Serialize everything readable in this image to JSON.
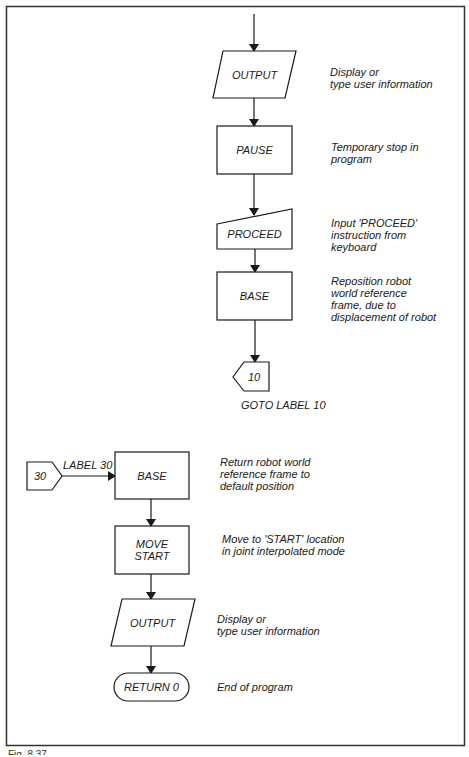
{
  "figure": {
    "type": "flowchart",
    "frame_color": "#333333",
    "line_color": "#1a1a1a",
    "caption": "Fig. 8.37"
  },
  "nodes": {
    "output1": {
      "shape": "parallelogram",
      "label": "OUTPUT",
      "annotation": "Display or\ntype user information"
    },
    "pause": {
      "shape": "process",
      "label": "PAUSE",
      "annotation": "Temporary stop in\nprogram"
    },
    "proceed": {
      "shape": "manual-input",
      "label": "PROCEED",
      "annotation": "Input 'PROCEED'\ninstruction from\nkeyboard"
    },
    "base1": {
      "shape": "process",
      "label": "BASE",
      "annotation": "Reposition robot\nworld reference\nframe, due to\ndisplacement of robot"
    },
    "goto10": {
      "shape": "off-page-connector",
      "label": "10",
      "annotation": "GOTO LABEL 10"
    },
    "label30": {
      "shape": "off-page-connector",
      "label": "30",
      "edge_label": "LABEL 30"
    },
    "base2": {
      "shape": "process",
      "label": "BASE",
      "annotation": "Return robot world\nreference frame to\ndefault position"
    },
    "move_start": {
      "shape": "process",
      "label": "MOVE\nSTART",
      "annotation": "Move to 'START' location\nin joint interpolated mode"
    },
    "output2": {
      "shape": "parallelogram",
      "label": "OUTPUT",
      "annotation": "Display or\ntype user information"
    },
    "return0": {
      "shape": "terminator",
      "label": "RETURN 0",
      "annotation": "End of program"
    }
  },
  "edges": [
    [
      "entry",
      "output1"
    ],
    [
      "output1",
      "pause"
    ],
    [
      "pause",
      "proceed"
    ],
    [
      "proceed",
      "base1"
    ],
    [
      "base1",
      "goto10"
    ],
    [
      "label30",
      "base2"
    ],
    [
      "base2",
      "move_start"
    ],
    [
      "move_start",
      "output2"
    ],
    [
      "output2",
      "return0"
    ]
  ]
}
